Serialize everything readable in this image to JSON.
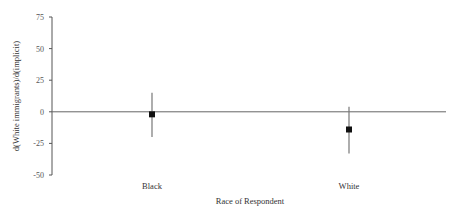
{
  "chart_data": {
    "type": "scatter",
    "subtype": "point-with-error-bars",
    "title": "",
    "xlabel": "Race of Respondent",
    "ylabel": "d(White immigrants)/d(implicit)",
    "ylim": [
      -50,
      75
    ],
    "yticks": [
      75,
      50,
      25,
      0,
      -25,
      -50
    ],
    "ytick_labels": [
      "75",
      "50",
      "25",
      "0",
      "-25",
      "-50"
    ],
    "grid": false,
    "legend": null,
    "reference_line": 0,
    "categories": [
      "Black",
      "White"
    ],
    "series": [
      {
        "name": "estimate",
        "values": [
          -2,
          -14
        ],
        "ci_lower": [
          -20,
          -33
        ],
        "ci_upper": [
          15,
          4
        ]
      }
    ]
  },
  "colors": {
    "axis": "#555555",
    "zero_line": "#666666",
    "marker": "#111111",
    "error_bar": "#777777"
  }
}
